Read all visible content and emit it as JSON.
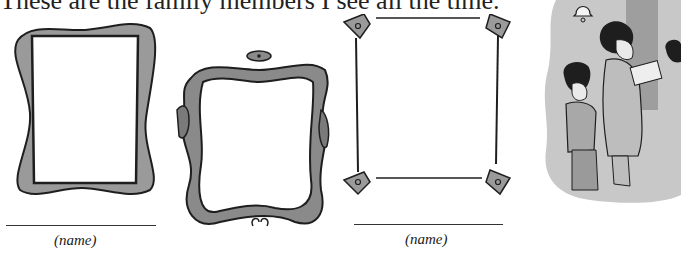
{
  "worksheet": {
    "heading": "These are the family members I see all the time.",
    "frames": [
      {
        "id": 1,
        "style": "wavy-thick-border",
        "name_label": "(name)",
        "has_name_line": true
      },
      {
        "id": 2,
        "style": "ornate-scroll-border",
        "name_label": null,
        "has_name_line": false
      },
      {
        "id": 3,
        "style": "thin-line-corner-diamonds",
        "name_label": "(name)",
        "has_name_line": true
      }
    ],
    "illustration": "family-members-at-door",
    "colors": {
      "frame_fill": "#9a9a9a",
      "frame_outline": "#1e1e1e",
      "illustration_bg": "#c8c8c8",
      "text": "#222222"
    }
  }
}
